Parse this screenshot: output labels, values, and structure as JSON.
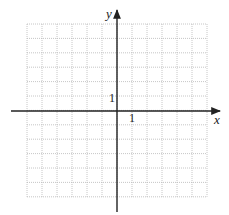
{
  "diagram": {
    "type": "coordinate-grid",
    "grid": {
      "x_min": -6,
      "x_max": 6,
      "y_min": -6,
      "y_max": 6,
      "left_px": 27,
      "top_px": 24,
      "cell_px_x": 15,
      "cell_px_y": 14.4,
      "line_color": "#b8b8b8",
      "line_style": "dotted"
    },
    "axes": {
      "color": "#222222",
      "x_label": "x",
      "y_label": "y",
      "x_tick_label": "1",
      "y_tick_label": "1"
    }
  }
}
